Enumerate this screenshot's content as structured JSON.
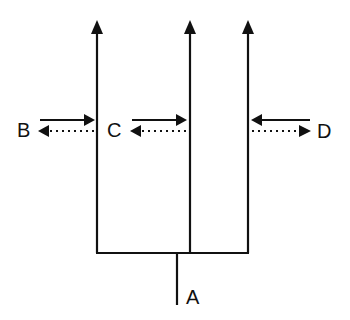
{
  "diagram": {
    "labels": {
      "A": "A",
      "B": "B",
      "C": "C",
      "D": "D"
    },
    "colors": {
      "line": "#111111",
      "background": "#ffffff"
    },
    "branches": [
      {
        "id": "left",
        "x": 97
      },
      {
        "id": "middle",
        "x": 190
      },
      {
        "id": "right",
        "x": 248
      }
    ],
    "flows": [
      {
        "label": "B",
        "solid_direction": "right",
        "dotted_direction": "left"
      },
      {
        "label": "C",
        "solid_direction": "right",
        "dotted_direction": "left"
      },
      {
        "label": "D",
        "solid_direction": "left",
        "dotted_direction": "right"
      }
    ]
  }
}
